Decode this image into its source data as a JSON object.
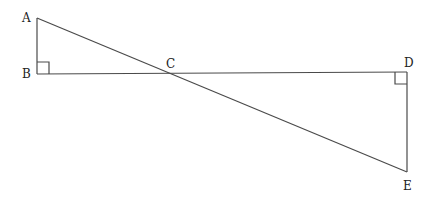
{
  "diagram": {
    "points": {
      "A": {
        "label": "A"
      },
      "B": {
        "label": "B"
      },
      "C": {
        "label": "C"
      },
      "D": {
        "label": "D"
      },
      "E": {
        "label": "E"
      }
    },
    "segments": [
      "AB",
      "BD",
      "AE",
      "DE"
    ],
    "right_angles": [
      "B",
      "D"
    ]
  }
}
